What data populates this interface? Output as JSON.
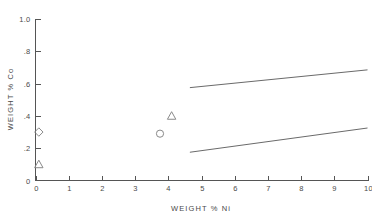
{
  "chart_data": {
    "type": "scatter",
    "title": "",
    "xlabel": "WEIGHT % Ni",
    "ylabel": "WEIGHT % Co",
    "xlim": [
      0,
      10
    ],
    "ylim": [
      0,
      1.0
    ],
    "grid": false,
    "legend": "none",
    "xticks": [
      "0",
      "1",
      "2",
      "3",
      "4",
      "5",
      "6",
      "7",
      "8",
      "9",
      "10"
    ],
    "xtick_values": [
      0,
      1,
      2,
      3,
      4,
      5,
      6,
      7,
      8,
      9,
      10
    ],
    "yticks": [
      "0",
      ".2",
      ".4",
      ".6",
      ".8",
      "1.0"
    ],
    "ytick_values": [
      0,
      0.2,
      0.4,
      0.6,
      0.8,
      1.0
    ],
    "points": [
      {
        "marker": "diamond",
        "x": 0.1,
        "y": 0.3
      },
      {
        "marker": "triangle",
        "x": 0.1,
        "y": 0.1
      },
      {
        "marker": "triangle",
        "x": 4.1,
        "y": 0.4
      },
      {
        "marker": "circle",
        "x": 3.75,
        "y": 0.29
      }
    ],
    "series": [
      {
        "name": "upper-boundary",
        "type": "line",
        "x": [
          4.65,
          10.0
        ],
        "y": [
          0.575,
          0.685
        ]
      },
      {
        "name": "lower-boundary",
        "type": "line",
        "x": [
          4.65,
          10.0
        ],
        "y": [
          0.175,
          0.325
        ]
      }
    ]
  },
  "colors": {
    "axis": "#555555",
    "text": "#4a4a4a",
    "marker": "#8a8a8a",
    "line": "#6a6a6a",
    "background": "#ffffff"
  }
}
